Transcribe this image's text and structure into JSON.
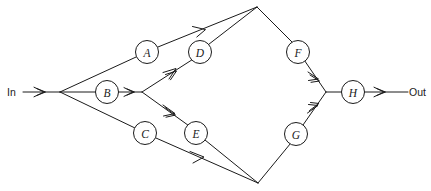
{
  "diagram": {
    "type": "network-block-diagram",
    "title": "",
    "background_color": "#ffffff",
    "line_color": "#1a1a1a",
    "node_fill_color": "#ffffff",
    "width": 431,
    "height": 191,
    "terminals": {
      "input": {
        "label": "In",
        "x": 8,
        "y": 92
      },
      "output": {
        "label": "Out",
        "x": 409,
        "y": 92
      }
    },
    "nodes": [
      {
        "id": "A",
        "label": "A",
        "cx": 147,
        "cy": 52,
        "r": 11.5
      },
      {
        "id": "B",
        "label": "B",
        "cx": 107,
        "cy": 92,
        "r": 11.5
      },
      {
        "id": "C",
        "label": "C",
        "cx": 145,
        "cy": 133,
        "r": 11.5
      },
      {
        "id": "D",
        "label": "D",
        "cx": 200,
        "cy": 52,
        "r": 11.5
      },
      {
        "id": "E",
        "label": "E",
        "cx": 196,
        "cy": 133,
        "r": 11.5
      },
      {
        "id": "F",
        "label": "F",
        "cx": 298,
        "cy": 52,
        "r": 11.5
      },
      {
        "id": "G",
        "label": "G",
        "cx": 296,
        "cy": 134,
        "r": 11.5
      },
      {
        "id": "H",
        "label": "H",
        "cx": 353,
        "cy": 92,
        "r": 11.5
      }
    ],
    "junctions": [
      {
        "id": "fan-out",
        "cx": 60,
        "cy": 92
      },
      {
        "id": "b-split",
        "cx": 142,
        "cy": 92
      },
      {
        "id": "top-apex",
        "cx": 257,
        "cy": 7
      },
      {
        "id": "bottom-apex",
        "cx": 258,
        "cy": 183
      },
      {
        "id": "merge",
        "cx": 326,
        "cy": 92
      }
    ],
    "edges": [
      {
        "id": "in-to-fanout",
        "from": "In",
        "to": "fan-out",
        "arrow": true
      },
      {
        "id": "fanout-to-a",
        "from": "fan-out",
        "to": "A",
        "arrow": false
      },
      {
        "id": "fanout-to-b",
        "from": "fan-out",
        "to": "B",
        "arrow": false
      },
      {
        "id": "fanout-to-c",
        "from": "fan-out",
        "to": "C",
        "arrow": false
      },
      {
        "id": "a-to-top-apex",
        "from": "A",
        "to": "top-apex",
        "arrow": true
      },
      {
        "id": "b-to-split",
        "from": "B",
        "to": "b-split",
        "arrow": true
      },
      {
        "id": "split-to-d",
        "from": "b-split",
        "to": "D",
        "arrow": true
      },
      {
        "id": "split-to-e",
        "from": "b-split",
        "to": "E",
        "arrow": true
      },
      {
        "id": "c-to-bottom-apex",
        "from": "C",
        "to": "bottom-apex",
        "arrow": true
      },
      {
        "id": "d-to-top-apex",
        "from": "D",
        "to": "top-apex",
        "arrow": false
      },
      {
        "id": "e-to-bottom-apex",
        "from": "E",
        "to": "bottom-apex",
        "arrow": false
      },
      {
        "id": "top-apex-to-f",
        "from": "top-apex",
        "to": "F",
        "arrow": false
      },
      {
        "id": "bottom-apex-to-g",
        "from": "bottom-apex",
        "to": "G",
        "arrow": false
      },
      {
        "id": "f-to-merge",
        "from": "F",
        "to": "merge",
        "arrow": true
      },
      {
        "id": "g-to-merge",
        "from": "G",
        "to": "merge",
        "arrow": true
      },
      {
        "id": "merge-to-h",
        "from": "merge",
        "to": "H",
        "arrow": false
      },
      {
        "id": "h-to-out",
        "from": "H",
        "to": "Out",
        "arrow": true
      }
    ]
  }
}
